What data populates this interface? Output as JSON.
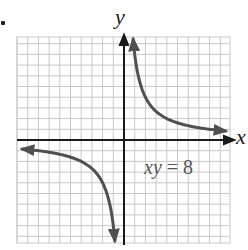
{
  "chart_data": {
    "type": "line",
    "title": "",
    "xlabel": "x",
    "ylabel": "y",
    "xlim": [
      -10,
      10
    ],
    "ylim": [
      -10,
      10
    ],
    "grid": true,
    "annotation": "xy = 8",
    "series": [
      {
        "name": "xy = 8 (quadrant I branch)",
        "x": [
          0.85,
          1,
          1.5,
          2,
          3,
          4,
          5,
          6,
          8,
          9.5
        ],
        "y": [
          9.4,
          8,
          5.33,
          4,
          2.67,
          2,
          1.6,
          1.33,
          1,
          0.84
        ]
      },
      {
        "name": "xy = 8 (quadrant III branch)",
        "x": [
          -9.5,
          -8,
          -6,
          -5,
          -4,
          -3,
          -2,
          -1.5,
          -1,
          -0.85
        ],
        "y": [
          -0.84,
          -1,
          -1.33,
          -1.6,
          -2,
          -2.67,
          -4,
          -5.33,
          -8,
          -9.4
        ]
      }
    ],
    "colors": {
      "curve": "#505050",
      "axes": "#1a1a1a",
      "grid": "#c8c8c8"
    }
  },
  "labels": {
    "x_axis": "x",
    "y_axis": "y",
    "equation_var": "xy",
    "equation_rest": " = 8"
  }
}
